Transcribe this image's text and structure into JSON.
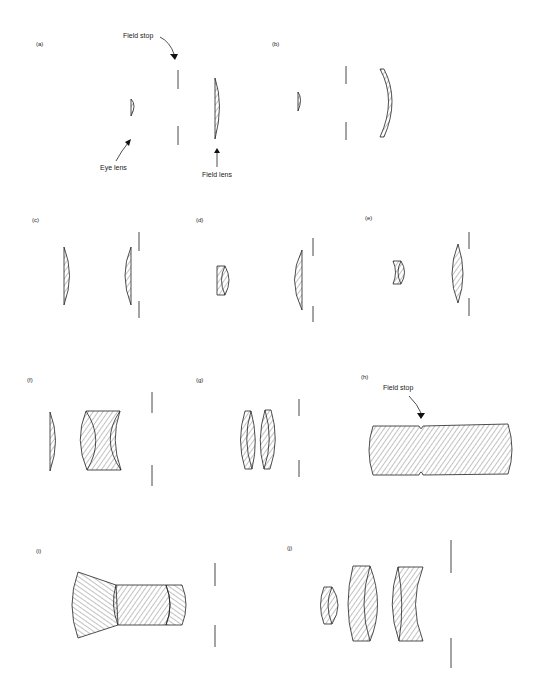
{
  "figure": {
    "panels": [
      {
        "id": "a",
        "label": "(a)",
        "annotations": [
          "Field stop",
          "Eye lens",
          "Field lens"
        ]
      },
      {
        "id": "b",
        "label": "(b)"
      },
      {
        "id": "c",
        "label": "(c)"
      },
      {
        "id": "d",
        "label": "(d)"
      },
      {
        "id": "e",
        "label": "(e)"
      },
      {
        "id": "f",
        "label": "(f)"
      },
      {
        "id": "g",
        "label": "(g)"
      },
      {
        "id": "h",
        "label": "(h)",
        "annotations": [
          "Field stop"
        ]
      },
      {
        "id": "i",
        "label": "(i)"
      },
      {
        "id": "j",
        "label": "(j)"
      }
    ],
    "annotations": {
      "a_field_stop": "Field stop",
      "a_eye_lens": "Eye lens",
      "a_field_lens": "Field lens",
      "h_field_stop": "Field stop"
    },
    "colors": {
      "ink": "#222222",
      "background": "#ffffff"
    }
  }
}
